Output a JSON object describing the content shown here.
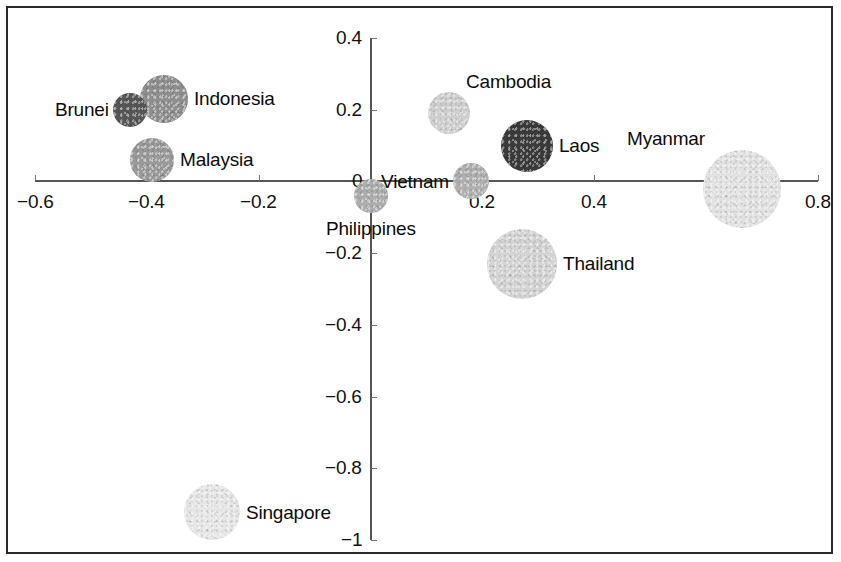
{
  "chart_data": {
    "type": "scatter",
    "title": "",
    "subtitle": "",
    "xlabel": "",
    "ylabel": "",
    "xlim": [
      -0.6,
      0.8
    ],
    "ylim": [
      -1.0,
      0.4
    ],
    "grid": false,
    "legend": "none",
    "note": "Bubble chart: each bubble is an ASEAN country positioned on two unlabeled axes; bubble area encodes a third magnitude and bubble shading varies per country.",
    "x_ticks": [
      "-0.6",
      "-0.4",
      "-0.2",
      "0",
      "0.2",
      "0.4",
      "0.8"
    ],
    "x_tick_values": [
      -0.6,
      -0.4,
      -0.2,
      0,
      0.2,
      0.4,
      0.8
    ],
    "x_tick_labels": [
      "−0.6",
      "−0.4",
      "−0.2",
      "0",
      "0.2",
      "0.4",
      "0.8"
    ],
    "y_ticks": [
      "0.4",
      "0.2",
      "0",
      "-0.2",
      "-0.4",
      "-0.6",
      "-0.8",
      "-1"
    ],
    "y_tick_values": [
      0.4,
      0.2,
      0,
      -0.2,
      -0.4,
      -0.6,
      -0.8,
      -1
    ],
    "y_tick_labels": [
      "0.4",
      "0.2",
      "0",
      "−0.2",
      "−0.4",
      "−0.6",
      "−0.8",
      "−1"
    ],
    "points": [
      {
        "label": "Brunei",
        "x": -0.43,
        "y": 0.2,
        "size": 17,
        "color": "#575757",
        "label_side": "left"
      },
      {
        "label": "Indonesia",
        "x": -0.37,
        "y": 0.23,
        "size": 24,
        "color": "#8f8f8f",
        "label_side": "right"
      },
      {
        "label": "Malaysia",
        "x": -0.39,
        "y": 0.06,
        "size": 22,
        "color": "#9a9a9a",
        "label_side": "right"
      },
      {
        "label": "Philippines",
        "x": 0.0,
        "y": -0.04,
        "size": 17,
        "color": "#adadad",
        "label_side": "below"
      },
      {
        "label": "Vietnam",
        "x": 0.18,
        "y": 0.0,
        "size": 18,
        "color": "#b0b0b0",
        "label_side": "left"
      },
      {
        "label": "Cambodia",
        "x": 0.14,
        "y": 0.19,
        "size": 21,
        "color": "#cfcfcf",
        "label_side": "above-right"
      },
      {
        "label": "Laos",
        "x": 0.28,
        "y": 0.1,
        "size": 26,
        "color": "#3b3b3b",
        "label_side": "right"
      },
      {
        "label": "Myanmar",
        "x": 0.665,
        "y": -0.02,
        "size": 39,
        "color": "#e2e2e2",
        "label_side": "above-left"
      },
      {
        "label": "Thailand",
        "x": 0.27,
        "y": -0.23,
        "size": 35,
        "color": "#d4d4d4",
        "label_side": "right"
      },
      {
        "label": "Singapore",
        "x": -0.283,
        "y": -0.922,
        "size": 28,
        "color": "#e6e6e6",
        "label_side": "right"
      }
    ]
  },
  "colors": {
    "frame": "#2a2a2a",
    "axis": "#555555",
    "tick": "#777777",
    "text": "#111111",
    "background": "#ffffff"
  }
}
